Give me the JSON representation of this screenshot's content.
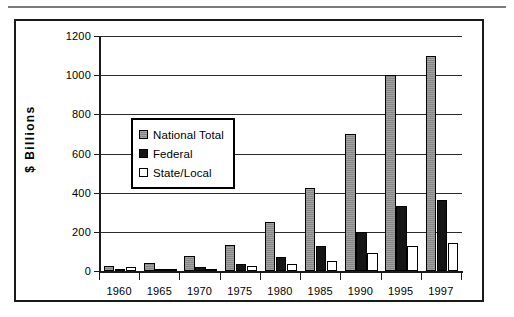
{
  "figure": {
    "has_top_rule": true,
    "frame_color": "#1a1a1a",
    "background": "#ffffff"
  },
  "axis": {
    "y_title": "$ Billions",
    "y_ticks": [
      0,
      200,
      400,
      600,
      800,
      1000,
      1200
    ],
    "y_tick_labels": [
      "0",
      "200",
      "400",
      "600",
      "800",
      "1000",
      "1200"
    ],
    "x_tick_labels": [
      "1960",
      "1965",
      "1970",
      "1975",
      "1980",
      "1985",
      "1990",
      "1995",
      "1997"
    ]
  },
  "legend": {
    "position": "inside-upper-left",
    "items": [
      {
        "label": "National Total",
        "color": "#8f8f8f",
        "swatch": "s-national"
      },
      {
        "label": "Federal",
        "color": "#151515",
        "swatch": "s-federal"
      },
      {
        "label": "State/Local",
        "color": "#ffffff",
        "swatch": "s-state"
      }
    ]
  },
  "chart_data": {
    "type": "bar",
    "title": "",
    "subtitle": "",
    "xlabel": "",
    "ylabel": "$ Billions",
    "ylim": [
      0,
      1200
    ],
    "ytick_step": 200,
    "grid": true,
    "grid_axis": "y",
    "legend_position": "inside upper-left",
    "categories": [
      "1960",
      "1965",
      "1970",
      "1975",
      "1980",
      "1985",
      "1990",
      "1995",
      "1997"
    ],
    "series": [
      {
        "name": "National Total",
        "color": "#8f8f8f",
        "values": [
          27,
          42,
          75,
          133,
          250,
          425,
          700,
          1000,
          1100
        ]
      },
      {
        "name": "Federal",
        "color": "#151515",
        "values": [
          9,
          10,
          18,
          35,
          70,
          130,
          200,
          330,
          365
        ]
      },
      {
        "name": "State/Local",
        "color": "#ffffff",
        "values": [
          18,
          12,
          12,
          25,
          37,
          50,
          90,
          130,
          145
        ]
      }
    ]
  }
}
